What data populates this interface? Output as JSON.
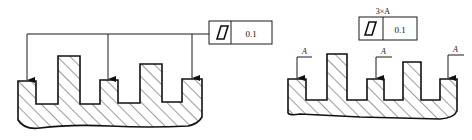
{
  "figures": [
    {
      "id": "left",
      "description": "Flatness tolerance applied to three coplanar surfaces via common leader",
      "frame": {
        "symbol": "flatness-icon",
        "tolerance": "0.1"
      },
      "leader_count": 3
    },
    {
      "id": "right",
      "description": "Flatness tolerance applied to three surfaces marked A",
      "frame": {
        "symbol": "flatness-icon",
        "tolerance": "0.1",
        "note": "3×A"
      },
      "surface_labels": [
        "A",
        "A",
        "A"
      ]
    }
  ],
  "colors": {
    "line": "#111111",
    "background": "#ffffff"
  }
}
